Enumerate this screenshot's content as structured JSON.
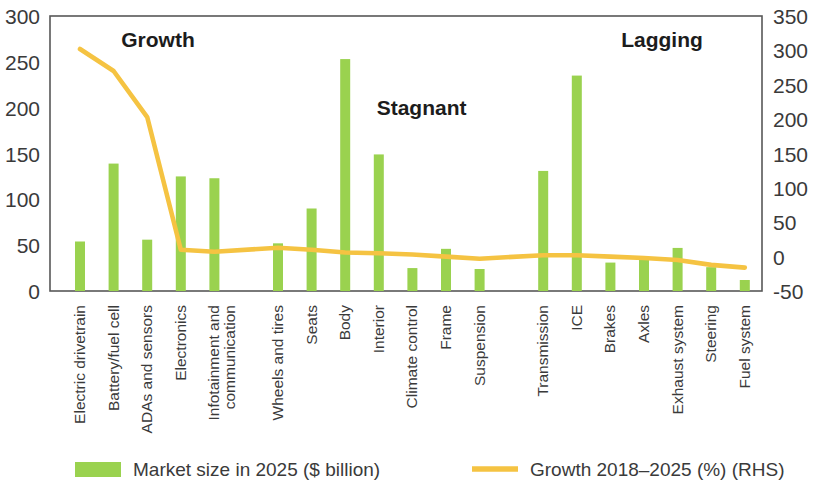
{
  "chart_data": {
    "type": "bar",
    "title": "",
    "subtitle": "",
    "xlabel": "",
    "ylabel": "",
    "y2label": "",
    "ylim": [
      0,
      300
    ],
    "y2lim": [
      -50,
      350
    ],
    "grid": false,
    "legend_position": "bottom",
    "left_axis_ticks": [
      "0",
      "50",
      "100",
      "150",
      "200",
      "250",
      "300"
    ],
    "left_axis_values": [
      0,
      50,
      100,
      150,
      200,
      250,
      300
    ],
    "right_axis_ticks": [
      "-50",
      "0",
      "50",
      "100",
      "150",
      "200",
      "250",
      "300",
      "350"
    ],
    "right_axis_values": [
      -50,
      0,
      50,
      100,
      150,
      200,
      250,
      300,
      350
    ],
    "categories": [
      "Electric drivetrain",
      "Battery/fuel cell",
      "ADAs and sensors",
      "Electronics",
      "Infotainment and communication",
      "Wheels and tires",
      "Seats",
      "Body",
      "Interior",
      "Climate control",
      "Frame",
      "Suspension",
      "Transmission",
      "ICE",
      "Brakes",
      "Axles",
      "Exhaust system",
      "Steering",
      "Fuel system"
    ],
    "series": [
      {
        "name": "Market size in 2025 ($ billion)",
        "type": "bar",
        "axis": "left",
        "color": "#9ad24f",
        "values": [
          54,
          139,
          56,
          125,
          123,
          52,
          90,
          253,
          149,
          25,
          46,
          24,
          131,
          235,
          31,
          37,
          47,
          26,
          12
        ]
      },
      {
        "name": "Growth 2018-2025 (%) (RHS)",
        "type": "line",
        "axis": "right",
        "color": "#f5c342",
        "values": [
          302,
          270,
          203,
          10,
          7,
          13,
          10,
          6,
          5,
          3,
          0,
          -3,
          2,
          2,
          0,
          -2,
          -5,
          -12,
          -16
        ]
      }
    ],
    "group_titles": [
      {
        "label": "Growth",
        "start_index": 0,
        "end_index": 4
      },
      {
        "label": "Stagnant",
        "start_index": 5,
        "end_index": 11
      },
      {
        "label": "Lagging",
        "start_index": 12,
        "end_index": 18
      }
    ],
    "legend": [
      {
        "label": "Market size in 2025 ($ billion)",
        "marker": "bar",
        "color": "#9ad24f"
      },
      {
        "label": "Growth 2018–2025 (%) (RHS)",
        "marker": "line",
        "color": "#f5c342"
      }
    ]
  }
}
